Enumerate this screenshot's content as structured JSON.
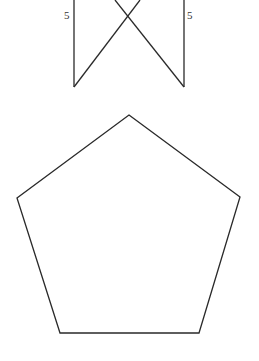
{
  "diagram": {
    "top_figure": {
      "left_side_label": "5",
      "right_side_label": "5",
      "segments": [
        {
          "name": "left-vertical",
          "x1": 74,
          "y1": 0,
          "x2": 74,
          "y2": 87
        },
        {
          "name": "right-vertical",
          "x1": 184,
          "y1": 0,
          "x2": 184,
          "y2": 87
        },
        {
          "name": "left-diagonal",
          "x1": 74,
          "y1": 87,
          "x2": 140,
          "y2": 0
        },
        {
          "name": "right-diagonal",
          "x1": 184,
          "y1": 87,
          "x2": 115,
          "y2": 0
        }
      ]
    },
    "pentagon": {
      "points": "129,115 240,197 199,333 60,333 17,198"
    }
  }
}
